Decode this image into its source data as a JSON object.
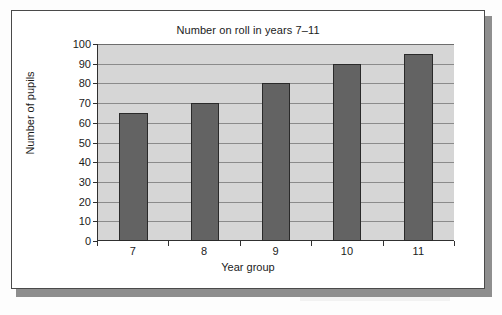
{
  "figure": {
    "title": "Number on roll in years 7–11"
  },
  "chart_data": {
    "type": "bar",
    "title": "Number on roll in years 7–11",
    "xlabel": "Year group",
    "ylabel": "Number of pupils",
    "categories": [
      "7",
      "8",
      "9",
      "10",
      "11"
    ],
    "values": [
      65,
      70,
      80,
      90,
      95
    ],
    "ylim": [
      0,
      100
    ],
    "ytick_labels": [
      "0",
      "10",
      "20",
      "30",
      "40",
      "50",
      "60",
      "70",
      "80",
      "90",
      "100"
    ],
    "ytick_values": [
      0,
      10,
      20,
      30,
      40,
      50,
      60,
      70,
      80,
      90,
      100
    ],
    "grid": true,
    "legend": false,
    "colors": {
      "bar_fill": "#636363",
      "bar_outline": "#2a2a2a",
      "plot_background": "#d6d6d6",
      "gridline": "#8b8b8b",
      "axis": "#303030",
      "text": "#1b1b1b",
      "frame_border": "#4a4a4a",
      "frame_shadow": "#8e8e8e",
      "page_background": "#fdfdfd"
    }
  }
}
